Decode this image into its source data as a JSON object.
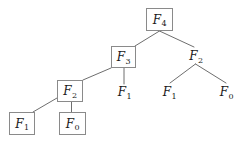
{
  "figure": {
    "kind": "recursion-tree",
    "title_visible": false,
    "background_color": "#ffffff",
    "box_border_color": "#8a8a8a",
    "edge_color": "#6e6e6e",
    "text_color": "#1a1a1a",
    "width": 246,
    "height": 145
  },
  "nodes": [
    {
      "id": "n0",
      "symbol": "F",
      "index": "4",
      "label": "F4",
      "boxed": true,
      "x": 146,
      "y": 8,
      "w": 27,
      "h": 23
    },
    {
      "id": "n1",
      "symbol": "F",
      "index": "3",
      "label": "F3",
      "boxed": true,
      "x": 111,
      "y": 46,
      "w": 25,
      "h": 22
    },
    {
      "id": "n2",
      "symbol": "F",
      "index": "2",
      "label": "F2",
      "boxed": false,
      "x": 185,
      "y": 48,
      "w": 22,
      "h": 16
    },
    {
      "id": "n3",
      "symbol": "F",
      "index": "2",
      "label": "F2",
      "boxed": true,
      "x": 57,
      "y": 80,
      "w": 26,
      "h": 22
    },
    {
      "id": "n4",
      "symbol": "F",
      "index": "1",
      "label": "F1",
      "boxed": false,
      "x": 114,
      "y": 84,
      "w": 21,
      "h": 16
    },
    {
      "id": "n5",
      "symbol": "F",
      "index": "1",
      "label": "F1",
      "boxed": false,
      "x": 159,
      "y": 84,
      "w": 21,
      "h": 16
    },
    {
      "id": "n6",
      "symbol": "F",
      "index": "0",
      "label": "F0",
      "boxed": false,
      "x": 216,
      "y": 84,
      "w": 21,
      "h": 16
    },
    {
      "id": "n7",
      "symbol": "F",
      "index": "1",
      "label": "F1",
      "boxed": true,
      "x": 9,
      "y": 112,
      "w": 26,
      "h": 23
    },
    {
      "id": "n8",
      "symbol": "F",
      "index": "0",
      "label": "F0",
      "boxed": true,
      "x": 59,
      "y": 112,
      "w": 27,
      "h": 23
    }
  ],
  "edges": [
    {
      "id": "e0",
      "from": "n0",
      "to": "n1",
      "x1": 159.5,
      "y1": 31,
      "x2": 135,
      "y2": 46
    },
    {
      "id": "e1",
      "from": "n0",
      "to": "n2",
      "x1": 159.5,
      "y1": 31,
      "x2": 194,
      "y2": 47
    },
    {
      "id": "e2",
      "from": "n1",
      "to": "n3",
      "x1": 111,
      "y1": 68,
      "x2": 83,
      "y2": 80
    },
    {
      "id": "e3",
      "from": "n1",
      "to": "n4",
      "x1": 124,
      "y1": 68,
      "x2": 124,
      "y2": 84
    },
    {
      "id": "e4",
      "from": "n2",
      "to": "n5",
      "x1": 195.5,
      "y1": 64,
      "x2": 170,
      "y2": 83
    },
    {
      "id": "e5",
      "from": "n2",
      "to": "n6",
      "x1": 195.5,
      "y1": 64,
      "x2": 226,
      "y2": 83
    },
    {
      "id": "e6",
      "from": "n3",
      "to": "n7",
      "x1": 57,
      "y1": 98,
      "x2": 33,
      "y2": 112
    },
    {
      "id": "e7",
      "from": "n3",
      "to": "n8",
      "x1": 71.5,
      "y1": 102,
      "x2": 71.5,
      "y2": 112
    }
  ]
}
